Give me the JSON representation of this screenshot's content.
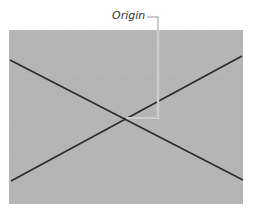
{
  "diagram": {
    "label": "Origin",
    "colors": {
      "plane": "#b3b3b3",
      "grid": "#a6a6a6",
      "axes": "#2b2b2b",
      "leader": "#ffffff"
    }
  }
}
